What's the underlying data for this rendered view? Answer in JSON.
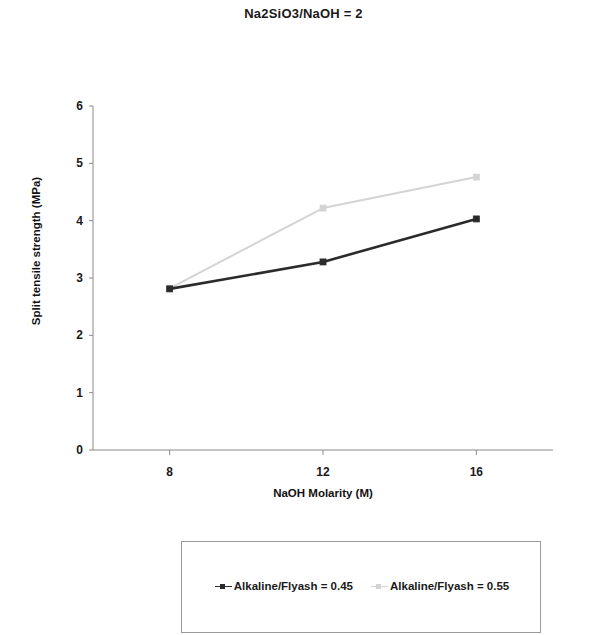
{
  "chart_data": {
    "type": "line",
    "title": "Na2SiO3/NaOH = 2",
    "xlabel": "NaOH Molarity (M)",
    "ylabel": "Split tensile strength (MPa)",
    "x": [
      8,
      12,
      16
    ],
    "xticklabels": [
      "8",
      "12",
      "16"
    ],
    "yticklabels": [
      "0",
      "1",
      "2",
      "3",
      "4",
      "5",
      "6"
    ],
    "yticks": [
      0,
      1,
      2,
      3,
      4,
      5,
      6
    ],
    "xlim": [
      6,
      18
    ],
    "ylim": [
      0,
      6
    ],
    "grid": false,
    "legend_position": "bottom",
    "series": [
      {
        "name": "Alkaline/Flyash = 0.45",
        "color": "#2b2b2b",
        "values": [
          2.81,
          3.28,
          4.03
        ]
      },
      {
        "name": "Alkaline/Flyash = 0.55",
        "color": "#d4d4d4",
        "values": [
          2.82,
          4.22,
          4.76
        ]
      }
    ]
  },
  "legend": {
    "items": [
      {
        "label": "Alkaline/Flyash = 0.45",
        "color": "#2b2b2b"
      },
      {
        "label": "Alkaline/Flyash = 0.55",
        "color": "#d4d4d4"
      }
    ]
  },
  "axis": {
    "line_color": "#8a8a8a"
  }
}
